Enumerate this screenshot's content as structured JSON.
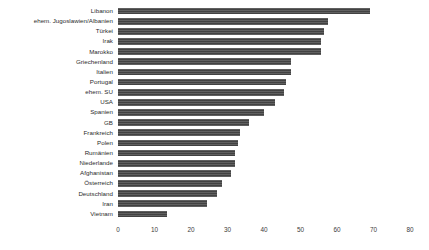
{
  "chart_data": {
    "type": "bar",
    "orientation": "horizontal",
    "title": "",
    "subtitle": "",
    "xlabel": "",
    "ylabel": "",
    "xlim": [
      0,
      80
    ],
    "xticks": [
      0,
      10,
      20,
      30,
      40,
      50,
      60,
      70,
      80
    ],
    "grid": false,
    "legend": null,
    "bar_color": "#4a4a4a",
    "background_color": "#ffffff",
    "categories": [
      "Libanon",
      "ehem. Jugoslawien/Albanien",
      "Türkei",
      "Irak",
      "Marokko",
      "Griechenland",
      "Italien",
      "Portugal",
      "ehem. SU",
      "USA",
      "Spanien",
      "GB",
      "Frankreich",
      "Polen",
      "Rumänien",
      "Niederlande",
      "Afghanistan",
      "Österreich",
      "Deutschland",
      "Iran",
      "Vietnam"
    ],
    "values": [
      69.0,
      57.5,
      56.5,
      55.5,
      55.5,
      47.5,
      47.5,
      46.0,
      45.5,
      43.0,
      40.0,
      36.0,
      33.5,
      33.0,
      32.0,
      32.0,
      31.0,
      28.5,
      27.0,
      24.5,
      13.5
    ]
  }
}
